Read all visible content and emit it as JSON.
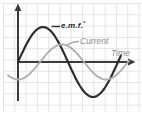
{
  "labels": {
    "emf": "e.m.f.",
    "emf_marker": "*",
    "current": "Current",
    "time": "Time"
  },
  "colors": {
    "axis": "#3a3a3a",
    "emf_curve": "#2d2d2d",
    "current_curve": "#aeaeae",
    "leader_dark": "#2d2d2d",
    "leader_gray": "#a9a9a9",
    "label_dark": "#1f1f1f",
    "label_gray": "#8d8d8d",
    "grid": "#e6e2e2",
    "background": "#ffffff"
  },
  "chart_data": {
    "type": "line",
    "title": "",
    "xlabel": "Time",
    "ylabel": "",
    "x_axis": {
      "label": "Time",
      "ticks": []
    },
    "y_axis": {
      "label": "",
      "ticks": []
    },
    "grid": true,
    "legend_position": "inline-annotations",
    "series": [
      {
        "name": "e.m.f.*",
        "waveform": "sine",
        "phase_deg": 0,
        "relative_amplitude": 1.0,
        "periods_shown": 1.03
      },
      {
        "name": "Current",
        "waveform": "sine",
        "phase_deg": -90,
        "relative_amplitude": 0.5,
        "periods_shown": 1.26
      }
    ],
    "relationship": "Current lags e.m.f. by 90 degrees (quarter period); both start at the origin axis"
  }
}
